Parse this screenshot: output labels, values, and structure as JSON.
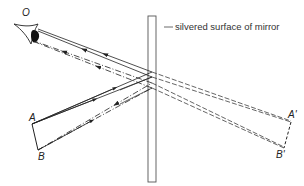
{
  "diagram": {
    "type": "plane mirror ray diagram",
    "labels": {
      "eye": "O",
      "object_top": "A",
      "object_bottom": "B",
      "image_top": "A'",
      "image_bottom": "B'",
      "mirror": "silvered surface of mirror"
    },
    "colors": {
      "line": "#222222",
      "mirror_edge": "#555555",
      "background": "#ffffff"
    }
  }
}
